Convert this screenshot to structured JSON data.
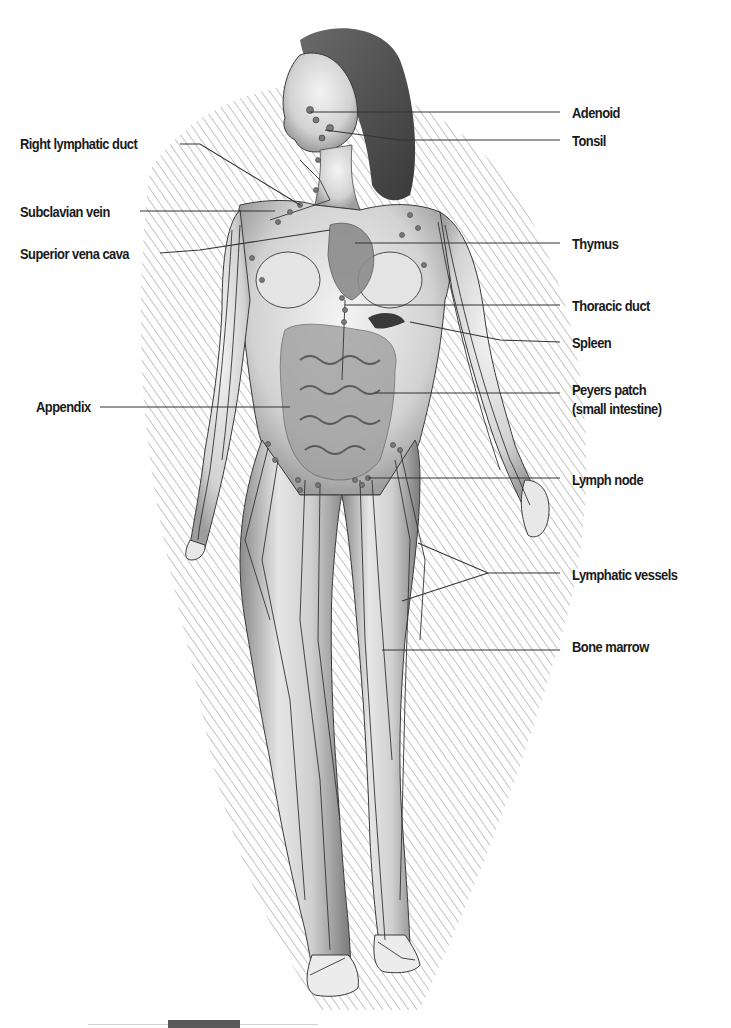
{
  "diagram": {
    "left_labels": [
      {
        "id": "right-lymphatic-duct",
        "text": "Right lymphatic duct",
        "x": 20,
        "y": 135
      },
      {
        "id": "subclavian-vein",
        "text": "Subclavian vein",
        "x": 20,
        "y": 203
      },
      {
        "id": "superior-vena-cava",
        "text": "Superior vena cava",
        "x": 20,
        "y": 245
      },
      {
        "id": "appendix",
        "text": "Appendix",
        "x": 36,
        "y": 398
      }
    ],
    "right_labels": [
      {
        "id": "adenoid",
        "text": "Adenoid",
        "x": 572,
        "y": 105
      },
      {
        "id": "tonsil",
        "text": "Tonsil",
        "x": 572,
        "y": 133
      },
      {
        "id": "thymus",
        "text": "Thymus",
        "x": 572,
        "y": 237
      },
      {
        "id": "thoracic-duct",
        "text": "Thoracic duct",
        "x": 572,
        "y": 300
      },
      {
        "id": "spleen",
        "text": "Spleen",
        "x": 572,
        "y": 336
      },
      {
        "id": "peyers-patch",
        "text": "Peyers patch",
        "x": 572,
        "y": 383
      },
      {
        "id": "peyers-patch-sub",
        "text": "(small intestine)",
        "x": 572,
        "y": 402
      },
      {
        "id": "lymph-node",
        "text": "Lymph node",
        "x": 572,
        "y": 474
      },
      {
        "id": "lymphatic-vessels",
        "text": "Lymphatic vessels",
        "x": 572,
        "y": 568
      },
      {
        "id": "bone-marrow",
        "text": "Bone marrow",
        "x": 572,
        "y": 638
      }
    ],
    "colors": {
      "label_text": "#1a1a1a",
      "leader_line": "#333333",
      "shading": "#9a9a9a",
      "figure_outline": "#3a3a3a",
      "organ_fill": "#8c8c8c",
      "background": "#ffffff"
    }
  }
}
